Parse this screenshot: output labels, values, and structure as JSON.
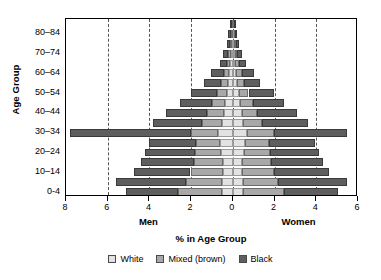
{
  "chart_data": {
    "type": "bar",
    "subtype": "population-pyramid",
    "title": "",
    "xlabel": "% in Age Group",
    "ylabel": "Age Group",
    "grid": true,
    "legend_position": "bottom",
    "xlim": [
      -8,
      6
    ],
    "x_axis_direction": "men-left-women-right",
    "x_ticks": [
      {
        "value": -8,
        "label": "8"
      },
      {
        "value": -6,
        "label": "6"
      },
      {
        "value": -4,
        "label": "4"
      },
      {
        "value": -2,
        "label": "2"
      },
      {
        "value": 0,
        "label": "0"
      },
      {
        "value": 2,
        "label": "2"
      },
      {
        "value": 4,
        "label": "4"
      },
      {
        "value": 6,
        "label": "6"
      }
    ],
    "gridline_values": [
      -6,
      -4,
      -2,
      0,
      2,
      4
    ],
    "side_labels": {
      "left": "Men",
      "right": "Women"
    },
    "categories": [
      "0-4",
      "5-9",
      "10-14",
      "15-19",
      "20-24",
      "25-29",
      "30-34",
      "35-39",
      "40-44",
      "45-49",
      "50-54",
      "55-59",
      "60-64",
      "65-69",
      "70-74",
      "75-79",
      "80-84",
      "85+"
    ],
    "y_tick_labels": [
      "80–84",
      "70–74",
      "60–64",
      "50–54",
      "40–44",
      "30–34",
      "20–24",
      "10–14",
      "0-4"
    ],
    "series": [
      {
        "name": "White",
        "color": "#e2e2e2",
        "men": [
          0.52,
          0.5,
          0.48,
          0.46,
          0.55,
          0.62,
          0.72,
          0.52,
          0.44,
          0.36,
          0.3,
          0.22,
          0.18,
          0.12,
          0.09,
          0.06,
          0.05,
          0.03
        ],
        "women": [
          0.5,
          0.48,
          0.46,
          0.45,
          0.54,
          0.6,
          0.7,
          0.5,
          0.42,
          0.35,
          0.29,
          0.21,
          0.17,
          0.12,
          0.09,
          0.06,
          0.05,
          0.03
        ]
      },
      {
        "name": "Mixed (brown)",
        "color": "#a8a8a8",
        "men": [
          2.1,
          1.75,
          1.55,
          1.4,
          1.25,
          1.15,
          1.3,
          0.95,
          0.78,
          0.62,
          0.48,
          0.34,
          0.26,
          0.16,
          0.12,
          0.07,
          0.05,
          0.03
        ],
        "women": [
          1.95,
          1.7,
          1.5,
          1.38,
          1.22,
          1.12,
          1.28,
          0.92,
          0.76,
          0.6,
          0.46,
          0.33,
          0.25,
          0.16,
          0.11,
          0.07,
          0.05,
          0.03
        ]
      },
      {
        "name": "Black",
        "color": "#5e5e5e",
        "men": [
          2.5,
          3.35,
          2.7,
          2.55,
          2.4,
          2.25,
          5.8,
          2.35,
          2.0,
          1.55,
          1.25,
          0.8,
          0.6,
          0.35,
          0.26,
          0.15,
          0.12,
          0.08
        ],
        "women": [
          2.6,
          3.3,
          2.65,
          2.5,
          2.35,
          2.2,
          3.5,
          2.2,
          1.9,
          1.5,
          1.2,
          0.78,
          0.58,
          0.34,
          0.25,
          0.15,
          0.12,
          0.08
        ]
      }
    ]
  },
  "legend": {
    "items": [
      {
        "label": "White",
        "swatch": "legend-swatch-white"
      },
      {
        "label": "Mixed (brown)",
        "swatch": "legend-swatch-mixed"
      },
      {
        "label": "Black",
        "swatch": "legend-swatch-black"
      }
    ]
  }
}
